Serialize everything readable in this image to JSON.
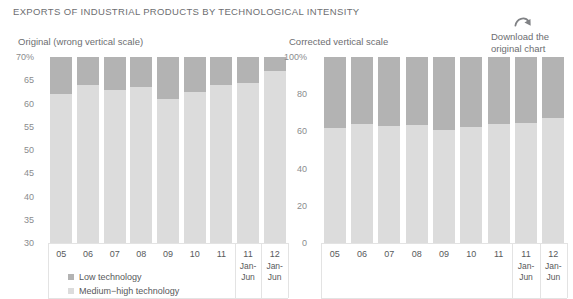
{
  "page": {
    "title": "EXPORTS OF INDUSTRIAL PRODUCTS BY TECHNOLOGICAL INTENSITY"
  },
  "download": {
    "icon": "curved-arrow-down-right-icon",
    "line1": "Download the",
    "line2": "original chart"
  },
  "legend": {
    "items": [
      {
        "label": "Low technology",
        "color": "#b3b3b3"
      },
      {
        "label": "Medium−high technology",
        "color": "#dcdcdc"
      }
    ]
  },
  "colors": {
    "low_technology": "#b3b3b3",
    "medium_high_technology": "#dcdcdc",
    "axis": "#e3e3e3",
    "grid": "#f2f2f2",
    "text": "#58595b",
    "muted_text": "#8a8c8e"
  },
  "chart_data": [
    {
      "id": "original",
      "type": "bar",
      "title": "Original (wrong vertical scale)",
      "xlabel": "",
      "ylabel": "",
      "ylim": [
        30,
        70
      ],
      "yticks": [
        70,
        65,
        60,
        55,
        50,
        45,
        40,
        35,
        30
      ],
      "ytick_labels": [
        "70%",
        "65",
        "60",
        "55",
        "50",
        "45",
        "40",
        "35",
        "30"
      ],
      "grid": false,
      "stacked": true,
      "legend_position": "bottom-left",
      "categories": [
        "05",
        "06",
        "07",
        "08",
        "09",
        "10",
        "11",
        "11",
        "12"
      ],
      "category_sublabels": [
        "",
        "",
        "",
        "",
        "",
        "",
        "",
        "Jan-Jun",
        "Jan-Jun"
      ],
      "series": [
        {
          "name": "Medium−high technology",
          "color": "#dcdcdc",
          "values": [
            62.0,
            64.0,
            63.0,
            63.5,
            61.0,
            62.5,
            64.0,
            64.5,
            67.0
          ]
        },
        {
          "name": "Low technology",
          "color": "#b3b3b3",
          "values": [
            8.0,
            6.0,
            7.0,
            6.5,
            9.0,
            7.5,
            6.0,
            5.5,
            3.0
          ]
        }
      ],
      "note": "vertical axis truncated at 30%, total of each bar is 70%"
    },
    {
      "id": "corrected",
      "type": "bar",
      "title": "Corrected vertical scale",
      "xlabel": "",
      "ylabel": "",
      "ylim": [
        0,
        100
      ],
      "yticks": [
        100,
        80,
        60,
        40,
        20,
        0
      ],
      "ytick_labels": [
        "100%",
        "80",
        "60",
        "40",
        "20",
        "0"
      ],
      "grid": false,
      "stacked": true,
      "legend_position": "none",
      "categories": [
        "05",
        "06",
        "07",
        "08",
        "09",
        "10",
        "11",
        "11",
        "12"
      ],
      "category_sublabels": [
        "",
        "",
        "",
        "",
        "",
        "",
        "",
        "Jan-Jun",
        "Jan-Jun"
      ],
      "series": [
        {
          "name": "Medium−high technology",
          "color": "#dcdcdc",
          "values": [
            62.0,
            64.0,
            63.0,
            63.5,
            61.0,
            62.5,
            64.0,
            64.5,
            67.0
          ]
        },
        {
          "name": "Low technology",
          "color": "#b3b3b3",
          "values": [
            38.0,
            36.0,
            37.0,
            36.5,
            39.0,
            37.5,
            36.0,
            35.5,
            33.0
          ]
        }
      ]
    }
  ]
}
